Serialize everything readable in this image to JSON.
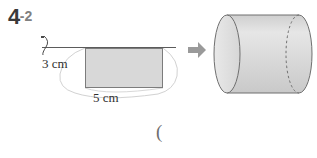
{
  "page": {
    "background_color": "#ffffff",
    "width": 317,
    "height": 158
  },
  "problem": {
    "number": "4",
    "subnumber": "-2",
    "number_color": "#3a3a3a",
    "subnumber_color": "#808080"
  },
  "left_figure": {
    "name": "rotating-rectangle-diagram",
    "axis_label_icon": "rotation-axis-hook-icon",
    "shape": "rectangle",
    "fill_color": "#d8d8d8",
    "stroke_color": "#7c7c7c",
    "height_label": "3 cm",
    "width_label": "5 cm",
    "height_value": 3,
    "width_value": 5,
    "unit": "cm"
  },
  "arrow": {
    "icon": "right-arrow-icon",
    "color": "#9a9a9a",
    "direction": "right"
  },
  "right_figure": {
    "name": "cylinder-diagram",
    "shape": "cylinder",
    "fill_color": "#dcdcdc",
    "stroke_color": "#6f6f6f",
    "hidden_edge_style": "dashed"
  },
  "stray_mark": {
    "text": "(",
    "color": "#6e6e6e"
  }
}
